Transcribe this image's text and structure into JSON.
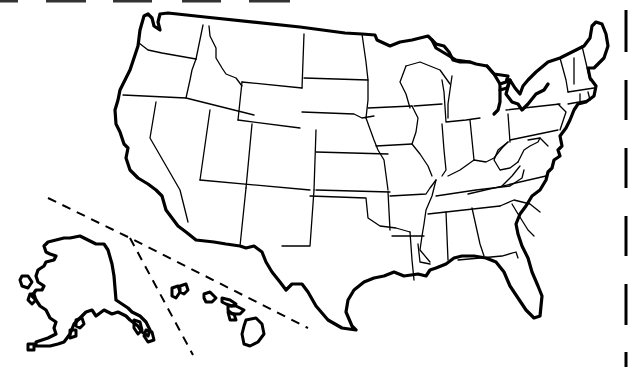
{
  "map": {
    "title": "",
    "type": "blank-outline-map",
    "subject": "United States of America",
    "labels_visible": false,
    "colors": {
      "background": "#ffffff",
      "line": "#000000"
    },
    "width": 636,
    "height": 367
  },
  "top_cut_marks": [
    {
      "x1": 0,
      "x2": 18,
      "y": 1
    },
    {
      "x1": 46,
      "x2": 86,
      "y": 1
    },
    {
      "x1": 113,
      "x2": 152,
      "y": 1
    },
    {
      "x1": 182,
      "x2": 221,
      "y": 1
    },
    {
      "x1": 249,
      "x2": 290,
      "y": 1
    }
  ],
  "right_cut_marks": [
    {
      "x": 626,
      "y1": 10,
      "y2": 52
    },
    {
      "x": 626,
      "y1": 80,
      "y2": 120
    },
    {
      "x": 626,
      "y1": 148,
      "y2": 188
    },
    {
      "x": 626,
      "y1": 216,
      "y2": 256
    },
    {
      "x": 626,
      "y1": 284,
      "y2": 325
    },
    {
      "x": 626,
      "y1": 352,
      "y2": 367
    }
  ],
  "inset_separators": [
    {
      "name": "upper-separator",
      "d": "M48,198 L130,238 L308,328"
    },
    {
      "name": "alaska-hawaii-divider",
      "d": "M130,238 L193,355"
    }
  ],
  "conus_outline": "M160,14 L168,13 L205,17 L300,27 L345,33 L362,34 L375,35 L377,40 L390,46 L400,42 L412,40 L428,36 L432,40 L436,44 L444,46 L449,52 L453,60 L460,62 L470,62 L476,64 L487,66 L494,74 L508,76 L506,82 L500,84 L500,90 L507,88 L510,80 L515,88 L520,94 L523,86 L528,80 L536,72 L548,62 L560,58 L572,52 L584,46 L590,38 L592,26 L596,22 L602,24 L606,34 L608,46 L604,58 L600,62 L594,68 L588,68 L590,78 L596,86 L594,96 L586,102 L578,104 L574,110 L570,120 L566,128 L560,136 L562,146 L558,150 L560,156 L554,160 L552,168 L548,172 L546,180 L540,190 L532,196 L526,206 L520,214 L516,224 L518,234 L522,246 L528,258 L532,272 L538,286 L542,296 L540,316 L534,318 L526,310 L518,298 L510,286 L504,272 L496,262 L486,258 L474,256 L462,256 L454,258 L446,264 L436,268 L430,270 L426,276 L418,274 L404,276 L394,272 L384,276 L374,278 L364,282 L354,290 L348,300 L346,312 L352,326 L356,330 L342,328 L328,320 L316,306 L308,292 L302,284 L292,284 L286,290 L280,282 L272,272 L266,262 L262,252 L254,246 L246,248 L240,246 L226,244 L214,242 L196,240 L186,232 L178,226 L172,218 L166,210 L162,196 L156,190 L148,184 L138,178 L130,170 L126,158 L128,148 L124,144 L120,132 L116,124 L115,110 L118,100 L120,90 L125,80 L130,70 L134,58 L138,46 L139,38 L140,30 L144,16 L148,14 L152,18 L154,26 L160,30 L158,22 Z",
  "great_lakes_shore": [
    "M432,40 L436,48 L446,54 L456,60 L470,62",
    "M487,66 L494,74 L500,84",
    "M500,90 L500,102 L498,110 L494,114",
    "M510,80 L506,94 L512,102 L518,104 L522,110 L528,104 L536,94 L544,90 L548,84"
  ],
  "state_borders": [
    {
      "name": "wa-or",
      "d": "M139,43 L148,50 L162,53 L196,59"
    },
    {
      "name": "wa-id",
      "d": "M203,25 L196,59"
    },
    {
      "name": "id-west",
      "d": "M196,59 L192,70 L190,80 L186,98"
    },
    {
      "name": "id-mt",
      "d": "M209,26 L210,36 L216,48 L216,58 L222,68 L226,74 L236,78 L242,86"
    },
    {
      "name": "or-south",
      "d": "M123,95 L186,98 L254,115"
    },
    {
      "name": "ca-nv",
      "d": "M156,102 L150,138 L180,190 L188,222"
    },
    {
      "name": "nv-ut",
      "d": "M210,110 L200,180"
    },
    {
      "name": "id-wy",
      "d": "M242,82 L238,120"
    },
    {
      "name": "mt-nd",
      "d": "M304,34 L302,88"
    },
    {
      "name": "wy-north",
      "d": "M242,82 L302,88"
    },
    {
      "name": "wy-south",
      "d": "M238,120 L300,128"
    },
    {
      "name": "ut-co",
      "d": "M252,124 L246,188"
    },
    {
      "name": "az-nm",
      "d": "M246,188 L240,246"
    },
    {
      "name": "ut-az",
      "d": "M200,180 L310,190"
    },
    {
      "name": "co-east",
      "d": "M316,130 L314,190"
    },
    {
      "name": "nm-tx",
      "d": "M314,190 L310,246 L282,246"
    },
    {
      "name": "nd-sd",
      "d": "M304,78 L368,80"
    },
    {
      "name": "sd-ne",
      "d": "M302,112 L354,114 L362,118 L374,116"
    },
    {
      "name": "ne-ks",
      "d": "M316,152 L388,154"
    },
    {
      "name": "ks-ok",
      "d": "M316,190 L390,192"
    },
    {
      "name": "ok-panhandle",
      "d": "M310,196 L366,198 L368,218 L380,226 L396,228 L410,232"
    },
    {
      "name": "ok-ar",
      "d": "M388,192 L390,230"
    },
    {
      "name": "tx-la",
      "d": "M410,232 L412,260 L414,280"
    },
    {
      "name": "mn-west",
      "d": "M362,34 L366,62 L368,80 L368,100 L366,118"
    },
    {
      "name": "mn-ia",
      "d": "M368,108 L412,106"
    },
    {
      "name": "ia-south",
      "d": "M376,146 L412,144"
    },
    {
      "name": "ne-east",
      "d": "M366,118 L374,140 L378,150 L384,160 L388,190"
    },
    {
      "name": "ia-il",
      "d": "M412,106 L418,118 L416,132 L412,144 L420,154 L428,166 L432,176"
    },
    {
      "name": "mo-ar",
      "d": "M390,196 L426,194 L430,188 L436,180"
    },
    {
      "name": "ar-la",
      "d": "M392,236 L424,236"
    },
    {
      "name": "ar-ms",
      "d": "M436,180 L432,196 L426,210 L424,224 L422,236 L420,250 L430,262"
    },
    {
      "name": "la-ms",
      "d": "M418,244 L420,262 L430,264"
    },
    {
      "name": "wi-mn",
      "d": "M406,66 L400,82 L406,94 L410,108"
    },
    {
      "name": "wi-mi-up",
      "d": "M406,66 L420,62 L440,70 L450,84"
    },
    {
      "name": "wi-il",
      "d": "M414,106 L442,104"
    },
    {
      "name": "mi-lp",
      "d": "M442,80 L444,92 L446,122 L466,120 L480,118"
    },
    {
      "name": "mi-lp-west",
      "d": "M452,76 L450,90 L448,104 L448,118"
    },
    {
      "name": "il-in",
      "d": "M442,124 L444,150 L446,170 L442,176"
    },
    {
      "name": "in-oh",
      "d": "M470,120 L474,160"
    },
    {
      "name": "oh-ky",
      "d": "M448,176 L460,170 L474,160 L486,162 L494,158 L502,148 L508,142"
    },
    {
      "name": "oh-pa",
      "d": "M508,114 L510,142"
    },
    {
      "name": "oh-wv",
      "d": "M508,142 L498,150 L494,160 L500,170 L510,168 L518,162"
    },
    {
      "name": "pa-north",
      "d": "M506,110 L560,104"
    },
    {
      "name": "pa-south",
      "d": "M510,140 L558,130"
    },
    {
      "name": "pa-east",
      "d": "M558,104 L566,112 L560,130"
    },
    {
      "name": "ny-vt",
      "d": "M560,58 L566,80 L568,92"
    },
    {
      "name": "vt-nh",
      "d": "M574,58 L574,84"
    },
    {
      "name": "nh-me",
      "d": "M582,46 L590,80"
    },
    {
      "name": "ny-ma",
      "d": "M568,92 L594,88"
    },
    {
      "name": "ma-ct-ri",
      "d": "M568,104 L590,100 L588,92"
    },
    {
      "name": "ct-ri",
      "d": "M580,94 L580,104"
    },
    {
      "name": "va-wv",
      "d": "M518,162 L524,150 L530,146 L538,142 L540,138"
    },
    {
      "name": "md-line",
      "d": "M528,140 L540,138 L548,146"
    },
    {
      "name": "va-nc",
      "d": "M468,194 L546,176"
    },
    {
      "name": "ky-tn",
      "d": "M436,196 L476,190 L510,186 L522,178 L524,170"
    },
    {
      "name": "ky-va",
      "d": "M502,186 L512,176 L520,166"
    },
    {
      "name": "tn-south",
      "d": "M428,214 L500,206"
    },
    {
      "name": "nc-sc",
      "d": "M500,206 L514,200 L530,204 L540,212"
    },
    {
      "name": "ms-al",
      "d": "M446,212 L448,260"
    },
    {
      "name": "al-ga",
      "d": "M472,208 L480,244 L484,256"
    },
    {
      "name": "ga-sc",
      "d": "M512,204 L518,214 L528,230 L534,236"
    },
    {
      "name": "fl-north",
      "d": "M458,260 L502,256 L516,252 L518,258"
    }
  ],
  "alaska": {
    "mainland": "M70,238 L80,236 L88,240 L96,244 L104,244 L108,250 L112,264 L114,276 L116,300 L122,304 L128,308 L132,312 L140,316 L146,322 L150,330 L148,336 L142,332 L138,326 L130,320 L126,316 L118,312 L112,314 L104,310 L96,316 L92,310 L86,312 L80,318 L74,324 L70,334 L64,342 L58,344 L50,346 L42,346 L36,346 L36,342 L42,340 L48,338 L56,334 L54,328 L56,322 L50,318 L46,310 L40,306 L36,300 L32,296 L36,290 L42,290 L44,286 L38,282 L36,276 L38,270 L44,266 L46,262 L54,260 L56,256 L50,254 L46,252 L44,246 L48,242 L56,240 L64,238 Z",
    "islands": [
      "M22,276 L28,276 L32,282 L28,288 L22,286 L20,280 Z",
      "M30,294 L34,294 L36,300 L32,304 L28,300 Z",
      "M28,344 L34,344 L34,350 L28,350 Z",
      "M134,320 L140,322 L142,330 L138,334 L134,328 Z",
      "M146,330 L152,332 L154,340 L148,342 L144,336 Z",
      "M76,320 L82,318 L84,324 L80,328 L76,326 Z",
      "M70,330 L76,330 L76,336 L70,338 Z"
    ]
  },
  "hawaii": {
    "islands": [
      "M172,288 L178,286 L180,292 L176,298 L172,296 Z",
      "M180,286 L186,284 L188,290 L184,294 L180,292 Z",
      "M204,294 L210,292 L216,298 L212,302 L206,302 L204,298 Z",
      "M222,298 L230,300 L236,304 L232,306 L226,304 L222,302 Z",
      "M228,306 L236,306 L244,310 L240,314 L232,314 L228,310 Z",
      "M228,312 L234,314 L236,320 L230,320 Z",
      "M246,320 L256,318 L262,324 L264,334 L258,342 L250,346 L244,344 L242,334 L244,326 Z"
    ]
  }
}
